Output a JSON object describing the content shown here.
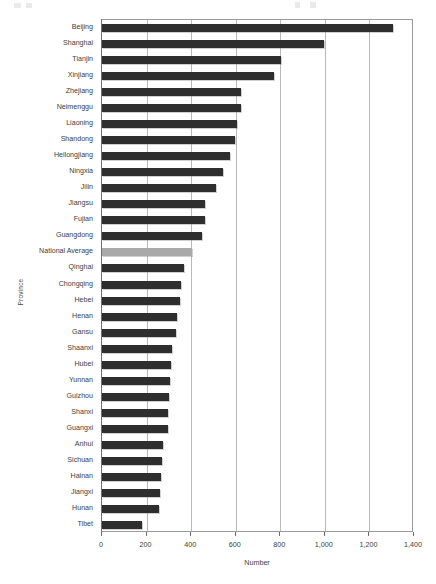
{
  "chart_data": {
    "type": "bar",
    "orientation": "horizontal",
    "title": "",
    "xlabel": "Number",
    "ylabel": "Province",
    "xlim": [
      0,
      1400
    ],
    "xticks": [
      0,
      200,
      400,
      600,
      800,
      1000,
      1200,
      1400
    ],
    "xtick_labels": [
      "0",
      "200",
      "400",
      "600",
      "800",
      "1,000",
      "1,200",
      "1,400"
    ],
    "grid": "vertical",
    "legend": "none",
    "bar_color": "#2e2e2e",
    "highlight_color": "#a9a9a9",
    "highlight_category": "National Average",
    "categories": [
      "Beijing",
      "Shanghai",
      "Tianjin",
      "Xinjiang",
      "Zhejiang",
      "Neimenggu",
      "Liaoning",
      "Shandong",
      "Heilongjiang",
      "Ningxia",
      "Jilin",
      "Jiangsu",
      "Fujian",
      "Guangdong",
      "National Average",
      "Qinghai",
      "Chongqing",
      "Hebei",
      "Henan",
      "Gansu",
      "Shaanxi",
      "Hubei",
      "Yunnan",
      "Guizhou",
      "Shanxi",
      "Guangxi",
      "Anhui",
      "Sichuan",
      "Hainan",
      "Jiangxi",
      "Hunan",
      "Tibet"
    ],
    "values": [
      1305,
      995,
      805,
      770,
      625,
      622,
      605,
      598,
      575,
      545,
      512,
      462,
      460,
      447,
      404,
      370,
      355,
      350,
      338,
      330,
      315,
      310,
      305,
      300,
      298,
      295,
      275,
      270,
      266,
      262,
      258,
      178
    ]
  }
}
